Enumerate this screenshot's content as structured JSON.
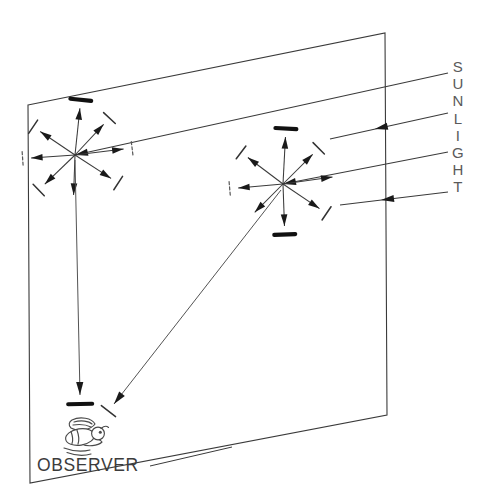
{
  "figure": {
    "domain": "Diagram",
    "background_color": "#ffffff",
    "line_color": "#3a3a3a",
    "ink_color": "#111111",
    "width": 493,
    "height": 495
  },
  "labels": {
    "sunlight": "SUNLIGHT",
    "sunlight_chars": [
      "S",
      "U",
      "N",
      "L",
      "I",
      "G",
      "H",
      "T"
    ],
    "observer": "OBSERVER"
  },
  "sky_plane": {
    "name": "sky-plane-parallelogram",
    "points": "28,105 385,33 387,415 30,483",
    "corners": [
      {
        "id": "top-left",
        "x": 28,
        "y": 105
      },
      {
        "id": "top-right",
        "x": 385,
        "y": 33
      },
      {
        "id": "bottom-right",
        "x": 387,
        "y": 415
      },
      {
        "id": "bottom-left",
        "x": 30,
        "y": 483
      }
    ]
  },
  "scatter_points": [
    {
      "id": "left-scatter-point",
      "x": 75,
      "y": 155
    },
    {
      "id": "right-scatter-point",
      "x": 283,
      "y": 184
    }
  ],
  "sunlight_rays": [
    {
      "id": "sun-ray-1",
      "x1": 448,
      "y1": 73,
      "x2": 75,
      "y2": 155,
      "arrow_at": null,
      "note": "reaches left scatter point"
    },
    {
      "id": "sun-ray-2",
      "x1": 448,
      "y1": 113,
      "x2": 330,
      "y2": 139,
      "arrow_at": 0.62,
      "note": "mid arrowhead"
    },
    {
      "id": "sun-ray-3",
      "x1": 448,
      "y1": 152,
      "x2": 283,
      "y2": 184,
      "arrow_at": null,
      "note": "reaches right scatter point"
    },
    {
      "id": "sun-ray-4",
      "x1": 448,
      "y1": 192,
      "x2": 340,
      "y2": 205,
      "arrow_at": 0.62,
      "note": "mid arrowhead"
    }
  ],
  "observer_rays": [
    {
      "id": "ray-to-observer-vertical",
      "x1": 75,
      "y1": 160,
      "x2": 80,
      "y2": 395,
      "polarization": "strong"
    },
    {
      "id": "ray-to-observer-diagonal",
      "x1": 281,
      "y1": 190,
      "x2": 114,
      "y2": 404,
      "polarization": "weak"
    }
  ],
  "left_star_rays": [
    {
      "id": "l-ray-n",
      "angle_deg": -84,
      "length": 47,
      "polarization": "strong"
    },
    {
      "id": "l-ray-ne",
      "angle_deg": -47,
      "length": 42,
      "polarization": "weak"
    },
    {
      "id": "l-ray-e",
      "angle_deg": -7,
      "length": 49,
      "polarization": "faint"
    },
    {
      "id": "l-ray-se",
      "angle_deg": 33,
      "length": 43,
      "polarization": "weak"
    },
    {
      "id": "l-ray-s",
      "angle_deg": 92,
      "length": 40,
      "polarization": "none"
    },
    {
      "id": "l-ray-sw",
      "angle_deg": 136,
      "length": 42,
      "polarization": "weak"
    },
    {
      "id": "l-ray-w",
      "angle_deg": 176,
      "length": 44,
      "polarization": "faint"
    },
    {
      "id": "l-ray-nw",
      "angle_deg": -146,
      "length": 42,
      "polarization": "weak"
    }
  ],
  "right_star_rays": [
    {
      "id": "r-ray-n",
      "angle_deg": -87,
      "length": 47,
      "polarization": "strong"
    },
    {
      "id": "r-ray-ne",
      "angle_deg": -45,
      "length": 42,
      "polarization": "weak"
    },
    {
      "id": "r-ray-e",
      "angle_deg": -8,
      "length": 50,
      "polarization": "none"
    },
    {
      "id": "r-ray-se",
      "angle_deg": 34,
      "length": 44,
      "polarization": "weak"
    },
    {
      "id": "r-ray-s",
      "angle_deg": 88,
      "length": 42,
      "polarization": "strong"
    },
    {
      "id": "r-ray-sw",
      "angle_deg": 135,
      "length": 40,
      "polarization": "none"
    },
    {
      "id": "r-ray-w",
      "angle_deg": 175,
      "length": 45,
      "polarization": "faint"
    },
    {
      "id": "r-ray-nw",
      "angle_deg": -143,
      "length": 44,
      "polarization": "weak"
    }
  ],
  "observer_icon": {
    "name": "bee-icon",
    "x": 58,
    "y": 418,
    "description": "stylized bee facing right with wings"
  },
  "leader": {
    "id": "observer-leader-line",
    "x1": 150,
    "y1": 466,
    "x2": 232,
    "y2": 447
  }
}
